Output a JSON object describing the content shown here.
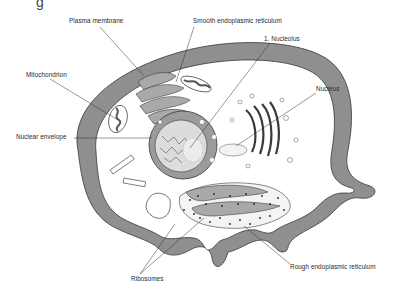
{
  "figure": {
    "type": "animal cell diagram",
    "colors": {
      "cytoplasm_fill": "#ffffff",
      "membrane_fill": "#8f8f8f",
      "organelle_fill": "#a9a9a9",
      "outline": "#3a3a3a",
      "ribosome": "#222222",
      "label_text": "#2a2a2a"
    }
  },
  "labels": [
    {
      "id": "plasma-membrane",
      "text": "Plasma membrane",
      "x": 69,
      "y": 21
    },
    {
      "id": "smooth-er",
      "text": "Smooth endoplasmic reticulum",
      "x": 195,
      "y": 21
    },
    {
      "id": "nucleolus",
      "text": "1. Nucleolus",
      "x": 264,
      "y": 37
    },
    {
      "id": "mitochondrion",
      "text": "Mitochondrion",
      "x": 26,
      "y": 73
    },
    {
      "id": "nucleus",
      "text": "Nucleus",
      "x": 316,
      "y": 87
    },
    {
      "id": "nuclear-envelope",
      "text": "Nuclear envelope",
      "x": 16,
      "y": 135
    },
    {
      "id": "ribosomes",
      "text": "Ribosomes",
      "x": 131,
      "y": 277
    },
    {
      "id": "rough-er",
      "text": "Rough endoplasmic reticulum",
      "x": 290,
      "y": 265
    }
  ],
  "top_cutoff_glyph": "g"
}
